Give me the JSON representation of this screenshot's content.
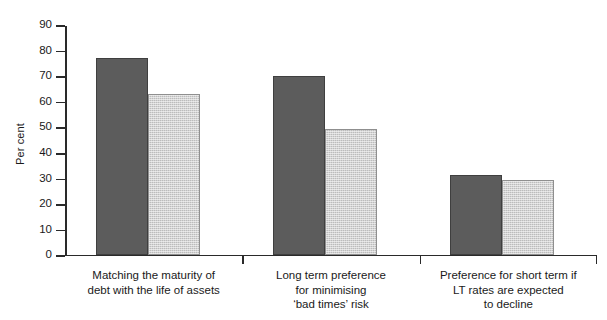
{
  "chart_data": {
    "type": "bar",
    "title": "",
    "xlabel": "",
    "ylabel": "Per cent",
    "ylim": [
      0,
      90
    ],
    "ytick_step": 10,
    "grid": false,
    "legend": "none",
    "categories": [
      "Matching the maturity of\ndebt with the life of assets",
      "Long term preference\nfor minimising\n‘bad times’ risk",
      "Preference for short term if\nLT rates are expected\nto decline"
    ],
    "yticks": [
      "0",
      "10",
      "20",
      "30",
      "40",
      "50",
      "60",
      "70",
      "80",
      "90"
    ],
    "series": [
      {
        "name": "series-1",
        "color": "#5c5c5c",
        "values": [
          77,
          70,
          31
        ]
      },
      {
        "name": "series-2",
        "color": "#bcbcbc",
        "values": [
          63,
          49,
          29
        ]
      }
    ]
  },
  "colors": {
    "dark_bar": "#5c5c5c",
    "light_bar": "#bcbcbc",
    "axis": "#2a2a2a",
    "background": "#ffffff"
  }
}
